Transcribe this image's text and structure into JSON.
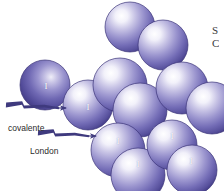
{
  "figure": {
    "background_color": "#ffffff",
    "width": 224,
    "height": 191
  },
  "palette": {
    "sphere_highlight": "#ffffff",
    "sphere_mid": "#9a96d0",
    "sphere_body": "#6a63ae",
    "sphere_rim": "#4b4490",
    "sphere_edge": "#3b3478",
    "arrow_color": "#3f3a7e",
    "label_color": "#2b2b2b",
    "atom_label_color": "#ffffff"
  },
  "atom_symbol": "I",
  "spheres": [
    {
      "name": "sphere-top-1",
      "cx": 130,
      "cy": 27,
      "r": 25,
      "shade": "bright",
      "label": ""
    },
    {
      "name": "sphere-top-2",
      "cx": 163,
      "cy": 45,
      "r": 25,
      "shade": "bright",
      "label": ""
    },
    {
      "name": "sphere-mid-1",
      "cx": 45,
      "cy": 85,
      "r": 25,
      "shade": "dark",
      "label": "I"
    },
    {
      "name": "sphere-mid-2",
      "cx": 88,
      "cy": 105,
      "r": 25,
      "shade": "bright",
      "label": "I"
    },
    {
      "name": "sphere-mid-3",
      "cx": 120,
      "cy": 85,
      "r": 27,
      "shade": "bright",
      "label": ""
    },
    {
      "name": "sphere-mid-4",
      "cx": 140,
      "cy": 110,
      "r": 27,
      "shade": "bright",
      "label": ""
    },
    {
      "name": "sphere-mid-5",
      "cx": 182,
      "cy": 88,
      "r": 26,
      "shade": "bright",
      "label": ""
    },
    {
      "name": "sphere-mid-6",
      "cx": 212,
      "cy": 108,
      "r": 26,
      "shade": "bright",
      "label": ""
    },
    {
      "name": "sphere-bot-1",
      "cx": 118,
      "cy": 150,
      "r": 27,
      "shade": "bright",
      "label": "I"
    },
    {
      "name": "sphere-bot-2",
      "cx": 138,
      "cy": 175,
      "r": 27,
      "shade": "bright",
      "label": "I"
    },
    {
      "name": "sphere-bot-3",
      "cx": 172,
      "cy": 145,
      "r": 25,
      "shade": "bright",
      "label": "I"
    },
    {
      "name": "sphere-bot-4",
      "cx": 192,
      "cy": 170,
      "r": 25,
      "shade": "bright",
      "label": "I"
    }
  ],
  "atom_labels": [
    {
      "name": "atom-label-1",
      "x": 46,
      "y": 86,
      "text": "I"
    },
    {
      "name": "atom-label-2",
      "x": 88,
      "y": 107,
      "text": "I"
    },
    {
      "name": "atom-label-3",
      "x": 118,
      "y": 141,
      "text": "I"
    },
    {
      "name": "atom-label-4",
      "x": 138,
      "y": 164,
      "text": "I"
    },
    {
      "name": "atom-label-5",
      "x": 172,
      "y": 136,
      "text": "I"
    },
    {
      "name": "atom-label-6",
      "x": 191,
      "y": 161,
      "text": "I"
    }
  ],
  "arrows": [
    {
      "name": "covalent-bond-arrow",
      "label": "covalente",
      "label_x": 8,
      "label_y": 124,
      "tail_x": 6,
      "tail_y": 105,
      "head_x": 66,
      "head_y": 108
    },
    {
      "name": "london-force-arrow",
      "label": "London",
      "label_x": 30,
      "label_y": 147,
      "tail_x": 38,
      "tail_y": 133,
      "head_x": 96,
      "head_y": 136
    }
  ],
  "edge_text": {
    "name": "cropped-side-text",
    "lines": [
      "S",
      "C"
    ],
    "x": 212,
    "y": 24
  }
}
